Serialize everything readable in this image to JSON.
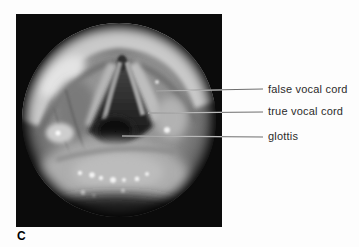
{
  "figure": {
    "panel_letter": "C",
    "annotations": [
      {
        "text": "false vocal cord"
      },
      {
        "text": "true vocal cord"
      },
      {
        "text": "glottis"
      }
    ]
  },
  "colors": {
    "page_background": "#fdfdfd",
    "frame_black": "#0b0b0b",
    "leader_line_over_photo": "#b9b9b9",
    "leader_line_over_page": "#6f6f6f",
    "label_text": "#2b2b2b",
    "panel_letter_text": "#000000"
  }
}
